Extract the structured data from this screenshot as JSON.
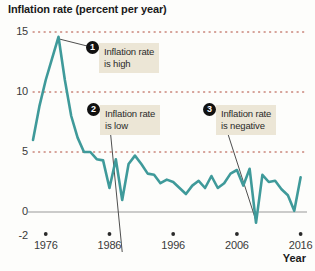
{
  "chart_data": {
    "type": "line",
    "title": "Inflation rate (percent per year)",
    "xlabel": "Year",
    "ylabel": "",
    "xlim": [
      1974,
      2017
    ],
    "ylim": [
      -2,
      15
    ],
    "grid": true,
    "grid_style": "dotted",
    "legend": "none",
    "line_color": "#3f9a9a",
    "series_name": "Inflation rate",
    "ytick_labels": [
      "15",
      "10",
      "5",
      "0",
      "-2"
    ],
    "ytick_values": [
      15,
      10,
      5,
      0,
      -2
    ],
    "xtick_labels": [
      "1976",
      "1986",
      "1996",
      "2006",
      "2016"
    ],
    "xtick_values": [
      1976,
      1986,
      1996,
      2006,
      2016
    ],
    "x": [
      1974,
      1975,
      1976,
      1977,
      1978,
      1979,
      1980,
      1981,
      1982,
      1983,
      1984,
      1985,
      1986,
      1987,
      1988,
      1989,
      1990,
      1991,
      1992,
      1993,
      1994,
      1995,
      1996,
      1997,
      1998,
      1999,
      2000,
      2001,
      2002,
      2003,
      2004,
      2005,
      2006,
      2007,
      2008,
      2009,
      2010,
      2011,
      2012,
      2013,
      2014,
      2015,
      2016
    ],
    "values": [
      6.0,
      8.8,
      11.0,
      12.8,
      14.6,
      11.0,
      8.0,
      6.2,
      5.0,
      5.0,
      4.4,
      4.3,
      2.0,
      4.4,
      1.0,
      4.0,
      4.7,
      4.0,
      3.2,
      3.1,
      2.4,
      2.7,
      2.5,
      2.0,
      1.5,
      2.2,
      2.6,
      2.0,
      3.0,
      2.0,
      2.4,
      3.2,
      3.5,
      2.2,
      3.6,
      -0.9,
      3.1,
      2.5,
      2.6,
      1.9,
      1.4,
      0.1,
      2.9
    ],
    "annotations": [
      {
        "number": "1",
        "line1": "Inflation rate",
        "line2": "is high",
        "points_to_year": 1978
      },
      {
        "number": "2",
        "line1": "Inflation rate",
        "line2": "is low",
        "points_to_year": 1988
      },
      {
        "number": "3",
        "line1": "Inflation rate",
        "line2": "is negative",
        "points_to_year": 2009
      }
    ]
  }
}
